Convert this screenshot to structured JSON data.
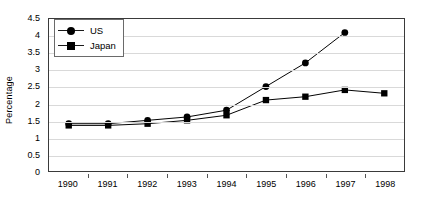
{
  "chart_data": {
    "type": "line",
    "title": "",
    "xlabel": "",
    "ylabel": "Percentage",
    "categories": [
      "1990",
      "1991",
      "1992",
      "1993",
      "1994",
      "1995",
      "1996",
      "1997",
      "1998"
    ],
    "ylim": [
      0,
      4.5
    ],
    "yticks": [
      "0",
      "0.5",
      "1",
      "1.5",
      "2",
      "2.5",
      "3",
      "3.5",
      "4",
      "4.5"
    ],
    "ytick_values": [
      0,
      0.5,
      1,
      1.5,
      2,
      2.5,
      3,
      3.5,
      4,
      4.5
    ],
    "grid": "horizontal",
    "legend_position": "top-left",
    "series": [
      {
        "name": "US",
        "marker": "circle",
        "color": "#000000",
        "values": [
          1.4,
          1.4,
          1.5,
          1.6,
          1.8,
          2.5,
          3.2,
          4.1,
          null
        ]
      },
      {
        "name": "Japan",
        "marker": "square",
        "color": "#000000",
        "values": [
          1.35,
          1.35,
          1.4,
          1.5,
          1.65,
          2.1,
          2.2,
          2.4,
          2.3
        ]
      }
    ]
  },
  "legend": {
    "items": [
      {
        "label": "US"
      },
      {
        "label": "Japan"
      }
    ]
  },
  "axes": {
    "y_title": "Percentage"
  }
}
